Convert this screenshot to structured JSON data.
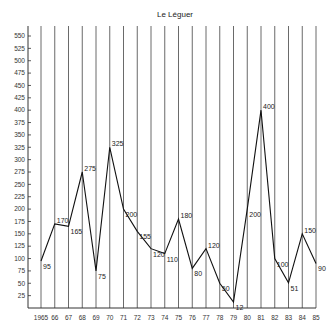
{
  "chart_data": {
    "type": "line",
    "title": "Le Léguer",
    "xlabel": "",
    "ylabel": "",
    "categories": [
      "1965",
      "66",
      "67",
      "68",
      "69",
      "70",
      "71",
      "72",
      "73",
      "74",
      "75",
      "76",
      "77",
      "78",
      "79",
      "80",
      "81",
      "82",
      "83",
      "84",
      "85"
    ],
    "series": [
      {
        "name": "Le Léguer",
        "values": [
          95,
          170,
          165,
          275,
          75,
          325,
          200,
          155,
          120,
          110,
          180,
          80,
          120,
          50,
          12,
          200,
          400,
          100,
          51,
          150,
          90
        ]
      }
    ],
    "point_labels": [
      "95",
      "170",
      "165",
      "275",
      "75",
      "325",
      "200",
      "155",
      "120",
      "110",
      "180",
      "80",
      "120",
      "50",
      "12",
      "200",
      "400",
      "100",
      "51",
      "150",
      "90"
    ],
    "yticks": [
      25,
      50,
      75,
      100,
      125,
      150,
      175,
      200,
      225,
      250,
      275,
      300,
      325,
      350,
      375,
      400,
      425,
      450,
      475,
      500,
      525,
      550
    ],
    "ylim": [
      0,
      565
    ],
    "grid": "vertical lines at each year",
    "legend": "none"
  }
}
